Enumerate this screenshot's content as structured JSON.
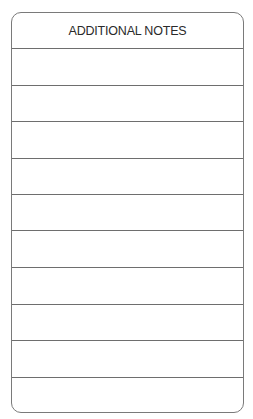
{
  "form": {
    "title": "ADDITIONAL NOTES",
    "line_count": 10,
    "lines": [
      "",
      "",
      "",
      "",
      "",
      "",
      "",
      "",
      "",
      ""
    ]
  }
}
